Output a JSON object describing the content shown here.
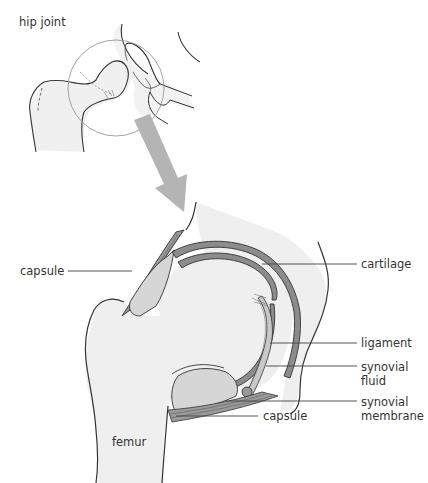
{
  "title": "hip joint",
  "colors": {
    "bone": "#efefef",
    "outline": "#333333",
    "cartilage": "#8c8c8c",
    "fluid": "#d6d6d6",
    "arrow": "#b4b4b4",
    "leader": "#444444"
  },
  "labels": {
    "hip_joint": "hip joint",
    "capsule_left": "capsule",
    "cartilage": "cartilage",
    "ligament": "ligament",
    "synovial_fluid_1": "synovial",
    "synovial_fluid_2": "fluid",
    "synovial_membrane_1": "synovial",
    "synovial_membrane_2": "membrane",
    "capsule_bottom": "capsule",
    "femur": "femur"
  }
}
